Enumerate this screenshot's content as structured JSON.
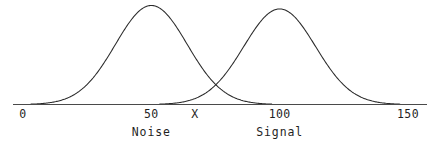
{
  "chart_data": {
    "type": "line",
    "title": "",
    "subtitle": "",
    "xlabel": "",
    "ylabel": "",
    "xlim": [
      0,
      150
    ],
    "ylim": [
      0,
      1
    ],
    "grid": false,
    "legend": "inline-below-axis",
    "axis": {
      "ticks": [
        {
          "value": 0,
          "label": "0"
        },
        {
          "value": 50,
          "label": "50"
        },
        {
          "value": 100,
          "label": "100"
        },
        {
          "value": 150,
          "label": "150"
        }
      ],
      "tick_labels": [
        "0",
        "50",
        "100",
        "150"
      ],
      "show_tick_marks": false,
      "line_color": "#4a4a4a"
    },
    "annotations": [
      {
        "name": "criterion",
        "label": "X",
        "x": 67,
        "description": "criterion / decision threshold at curve intersection"
      }
    ],
    "series": [
      {
        "name": "Noise",
        "label": "Noise",
        "type": "gaussian",
        "mean": 50,
        "sigma": 14,
        "peak_height": 1.0,
        "color": "#2a2a2a",
        "label_x": 50
      },
      {
        "name": "Signal",
        "label": "Signal",
        "type": "gaussian",
        "mean": 100,
        "sigma": 14,
        "peak_height": 0.965,
        "color": "#2a2a2a",
        "label_x": 100
      }
    ]
  },
  "figure": {
    "background_color": "#ffffff",
    "stroke_color": "#2a2a2a"
  }
}
